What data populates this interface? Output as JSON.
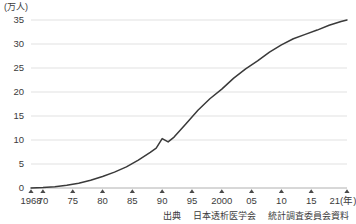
{
  "chart_data": {
    "type": "line",
    "title": "",
    "subtitle": "",
    "xlabel": "(年)",
    "ylabel": "(万人)",
    "unit_label": "(万人)",
    "x_axis_unit": "(年)",
    "grid": true,
    "legend": false,
    "legend_position": "none",
    "xlim": [
      1968,
      2021
    ],
    "ylim": [
      0,
      35
    ],
    "yticks": [
      0,
      5,
      10,
      15,
      20,
      25,
      30,
      35
    ],
    "ytick_labels": [
      "0",
      "5",
      "10",
      "15",
      "20",
      "25",
      "30",
      "35"
    ],
    "xticks": [
      1968,
      1970,
      1975,
      1980,
      1985,
      1990,
      1995,
      2000,
      2005,
      2010,
      2015,
      2021
    ],
    "xtick_labels": [
      "1968",
      "70",
      "75",
      "80",
      "85",
      "90",
      "95",
      "2000",
      "05",
      "10",
      "15",
      "21"
    ],
    "xtick_marker": "triangle-up",
    "line_color": "#3a3a3a",
    "grid_color": "#d9d9d9",
    "axis_color": "#b0b0b0",
    "series": [
      {
        "name": "透析患者数",
        "x": [
          1968,
          1970,
          1972,
          1974,
          1976,
          1978,
          1980,
          1982,
          1984,
          1986,
          1988,
          1989,
          1990,
          1991,
          1992,
          1994,
          1996,
          1998,
          2000,
          2002,
          2004,
          2006,
          2008,
          2010,
          2012,
          2014,
          2016,
          2018,
          2020,
          2021
        ],
        "values": [
          0.02,
          0.09,
          0.25,
          0.55,
          1.0,
          1.6,
          2.4,
          3.3,
          4.4,
          5.8,
          7.4,
          8.3,
          10.3,
          9.6,
          10.6,
          13.4,
          16.2,
          18.6,
          20.6,
          22.9,
          24.8,
          26.5,
          28.3,
          29.8,
          31.1,
          32.0,
          32.9,
          33.9,
          34.7,
          35.0
        ]
      }
    ],
    "annotations": [],
    "source": {
      "prefix": "出典",
      "organization": "日本透析医学会",
      "document": "統計調査委員会資料"
    }
  }
}
